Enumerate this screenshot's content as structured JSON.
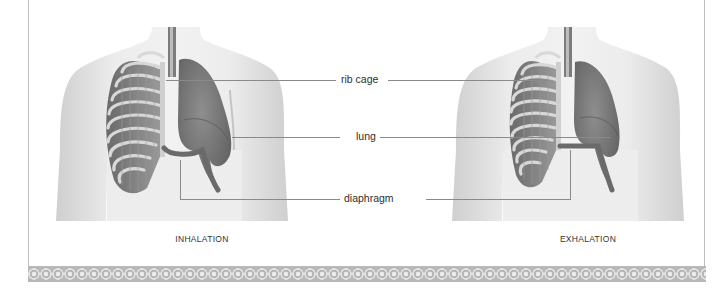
{
  "diagram": {
    "labels": {
      "rib_cage": "rib cage",
      "lung": "lung",
      "diaphragm": "diaphragm"
    },
    "panels": [
      {
        "id": "inhalation",
        "caption": "INHALATION"
      },
      {
        "id": "exhalation",
        "caption": "EXHALATION"
      }
    ],
    "colors": {
      "skin": "#e6e6e6",
      "skin_shadow": "#c9c9c9",
      "lung": "#7a7a7a",
      "rib": "#d0d0d0",
      "leader_line": "#8a8a8a",
      "frame": "#bdbdbd",
      "border_strip": "#b8b8b8"
    }
  }
}
